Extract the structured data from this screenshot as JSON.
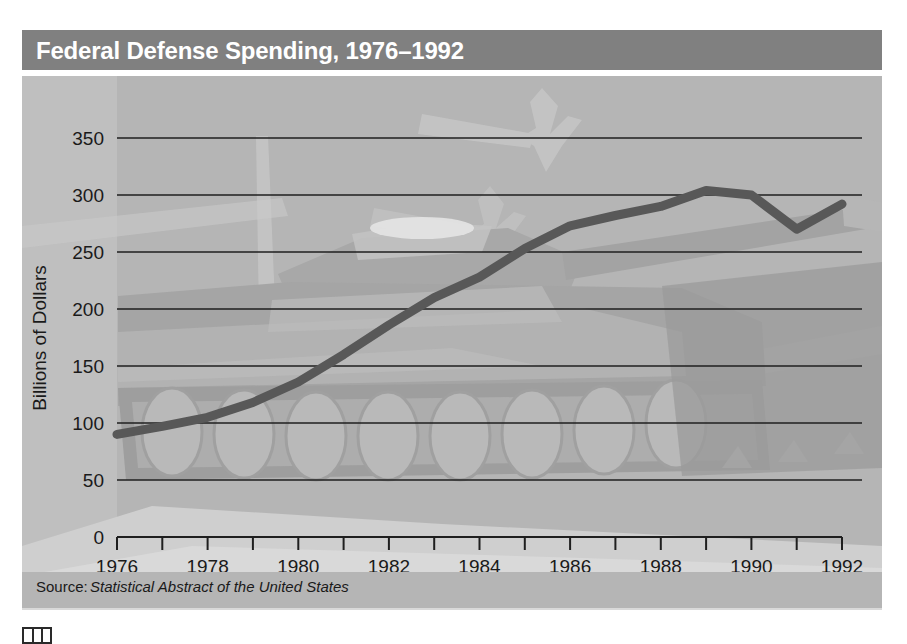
{
  "header": {
    "title": "Federal Defense Spending, 1976–1992",
    "bar_color": "#808080",
    "text_color": "#ffffff"
  },
  "panel": {
    "background_color": "#b5b5b5",
    "art_description": "military-silhouettes-tank-and-jets"
  },
  "source_note": {
    "prefix": "Source:",
    "publication": "Statistical Abstract of the United States"
  },
  "chart_data": {
    "type": "line",
    "title": "Federal Defense Spending, 1976–1992",
    "xlabel": "Year",
    "ylabel": "Billions of Dollars",
    "xlim": [
      1976,
      1992
    ],
    "ylim": [
      0,
      350
    ],
    "grid": true,
    "legend": "none",
    "line_color": "#585858",
    "line_width": 9,
    "y_ticks": [
      0,
      50,
      100,
      150,
      200,
      250,
      300,
      350
    ],
    "y_tick_labels": [
      "0",
      "50",
      "100",
      "150",
      "200",
      "250",
      "300",
      "350"
    ],
    "x_ticks": [
      1976,
      1977,
      1978,
      1979,
      1980,
      1981,
      1982,
      1983,
      1984,
      1985,
      1986,
      1987,
      1988,
      1989,
      1990,
      1991,
      1992
    ],
    "x_tick_labels_shown": [
      "1976",
      "1978",
      "1980",
      "1982",
      "1984",
      "1986",
      "1988",
      "1990",
      "1992"
    ],
    "x": [
      1976,
      1977,
      1978,
      1979,
      1980,
      1981,
      1982,
      1983,
      1984,
      1985,
      1986,
      1987,
      1988,
      1989,
      1990,
      1991,
      1992
    ],
    "values": [
      90,
      97,
      105,
      118,
      136,
      160,
      186,
      210,
      228,
      253,
      273,
      282,
      290,
      304,
      300,
      270,
      292
    ],
    "series": [
      {
        "name": "Federal Defense Spending",
        "values": [
          90,
          97,
          105,
          118,
          136,
          160,
          186,
          210,
          228,
          253,
          273,
          282,
          290,
          304,
          300,
          270,
          292
        ]
      }
    ]
  }
}
